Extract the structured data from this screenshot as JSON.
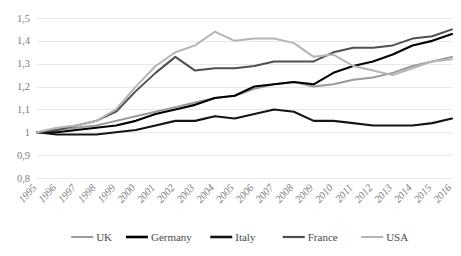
{
  "chart_data": {
    "type": "line",
    "title": "",
    "subtitle": "",
    "xlabel": "",
    "ylabel": "",
    "grid": true,
    "legend_position": "bottom",
    "xlim": [
      1995,
      2016
    ],
    "ylim": [
      0.8,
      1.5
    ],
    "ytick_labels": [
      "1,5",
      "1,4",
      "1,3",
      "1,2",
      "1,1",
      "1",
      "0,9",
      "0,8"
    ],
    "ytick_values": [
      1.5,
      1.4,
      1.3,
      1.2,
      1.1,
      1.0,
      0.9,
      0.8
    ],
    "categories": [
      1995,
      1996,
      1997,
      1998,
      1999,
      2000,
      2001,
      2002,
      2003,
      2004,
      2005,
      2006,
      2007,
      2008,
      2009,
      2010,
      2011,
      2012,
      2013,
      2014,
      2015,
      2016
    ],
    "xtick_labels": [
      "1995",
      "1996",
      "1997",
      "1998",
      "1999",
      "2000",
      "2001",
      "2002",
      "2003",
      "2004",
      "2005",
      "2006",
      "2007",
      "2008",
      "2009",
      "2010",
      "2011",
      "2012",
      "2013",
      "2014",
      "2015",
      "2016"
    ],
    "series": [
      {
        "name": "UK",
        "color": "#9a9a9a",
        "width": 2.0,
        "values": [
          1.0,
          1.01,
          1.02,
          1.03,
          1.05,
          1.07,
          1.09,
          1.11,
          1.13,
          1.15,
          1.16,
          1.19,
          1.21,
          1.22,
          1.2,
          1.21,
          1.23,
          1.24,
          1.26,
          1.29,
          1.31,
          1.33
        ]
      },
      {
        "name": "Germany",
        "color": "#000000",
        "width": 2.1,
        "values": [
          1.0,
          1.0,
          1.01,
          1.02,
          1.03,
          1.05,
          1.08,
          1.1,
          1.12,
          1.15,
          1.16,
          1.2,
          1.21,
          1.22,
          1.21,
          1.26,
          1.29,
          1.31,
          1.34,
          1.38,
          1.4,
          1.43
        ]
      },
      {
        "name": "Italy",
        "color": "#141414",
        "width": 2.1,
        "values": [
          1.0,
          0.99,
          0.99,
          0.99,
          1.0,
          1.01,
          1.03,
          1.05,
          1.05,
          1.07,
          1.06,
          1.08,
          1.1,
          1.09,
          1.05,
          1.05,
          1.04,
          1.03,
          1.03,
          1.03,
          1.04,
          1.06
        ]
      },
      {
        "name": "France",
        "color": "#4f4f4f",
        "width": 2.0,
        "values": [
          1.0,
          1.01,
          1.03,
          1.05,
          1.09,
          1.18,
          1.26,
          1.33,
          1.27,
          1.28,
          1.28,
          1.29,
          1.31,
          1.31,
          1.31,
          1.35,
          1.37,
          1.37,
          1.38,
          1.41,
          1.42,
          1.45
        ]
      },
      {
        "name": "USA",
        "color": "#b5b5b5",
        "width": 2.0,
        "values": [
          1.0,
          1.02,
          1.03,
          1.05,
          1.1,
          1.2,
          1.29,
          1.35,
          1.38,
          1.44,
          1.4,
          1.41,
          1.41,
          1.39,
          1.33,
          1.34,
          1.29,
          1.27,
          1.25,
          1.28,
          1.31,
          1.32
        ]
      }
    ],
    "legend": [
      {
        "label": "UK",
        "color": "#9a9a9a",
        "width": 2.0
      },
      {
        "label": "Germany",
        "color": "#000000",
        "width": 2.6
      },
      {
        "label": "Italy",
        "color": "#141414",
        "width": 2.6
      },
      {
        "label": "France",
        "color": "#4f4f4f",
        "width": 2.2
      },
      {
        "label": "USA",
        "color": "#b5b5b5",
        "width": 2.0
      }
    ]
  }
}
